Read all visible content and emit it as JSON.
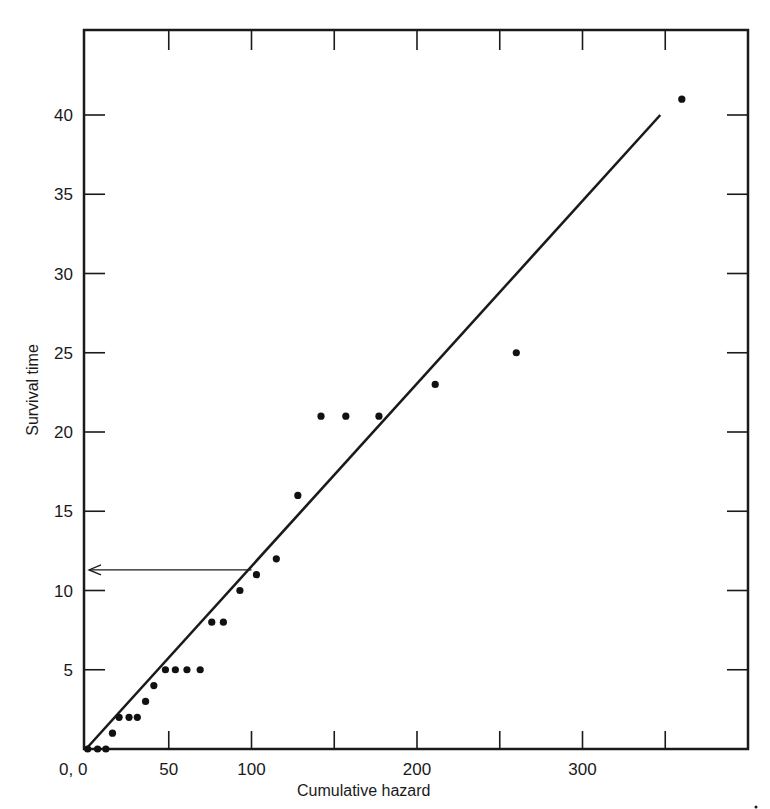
{
  "chart_data": {
    "type": "scatter",
    "title": "",
    "xlabel": "Cumulative hazard",
    "ylabel": "Survival time",
    "xlim": [
      0,
      400
    ],
    "ylim": [
      0,
      43
    ],
    "grid": false,
    "legend": null,
    "x_tick_labels": [
      {
        "value": 0,
        "label": "0, 0"
      },
      {
        "value": 50,
        "label": "50"
      },
      {
        "value": 100,
        "label": "100"
      },
      {
        "value": 200,
        "label": "200"
      },
      {
        "value": 300,
        "label": "300"
      }
    ],
    "x_ticks": [
      50,
      100,
      150,
      200,
      250,
      300,
      350
    ],
    "y_tick_labels": [
      {
        "value": 5,
        "label": "5"
      },
      {
        "value": 10,
        "label": "10"
      },
      {
        "value": 15,
        "label": "15"
      },
      {
        "value": 20,
        "label": "20"
      },
      {
        "value": 25,
        "label": "25"
      },
      {
        "value": 30,
        "label": "30"
      },
      {
        "value": 35,
        "label": "35"
      },
      {
        "value": 40,
        "label": "40"
      }
    ],
    "series": [
      {
        "name": "observations",
        "points": [
          {
            "x": 1,
            "y": 0
          },
          {
            "x": 7,
            "y": 0
          },
          {
            "x": 12,
            "y": 0
          },
          {
            "x": 16,
            "y": 1
          },
          {
            "x": 20,
            "y": 2
          },
          {
            "x": 26,
            "y": 2
          },
          {
            "x": 31,
            "y": 2
          },
          {
            "x": 36,
            "y": 3
          },
          {
            "x": 41,
            "y": 4
          },
          {
            "x": 48,
            "y": 5
          },
          {
            "x": 54,
            "y": 5
          },
          {
            "x": 61,
            "y": 5
          },
          {
            "x": 69,
            "y": 5
          },
          {
            "x": 76,
            "y": 8
          },
          {
            "x": 83,
            "y": 8
          },
          {
            "x": 93,
            "y": 10
          },
          {
            "x": 103,
            "y": 11
          },
          {
            "x": 115,
            "y": 12
          },
          {
            "x": 128,
            "y": 16
          },
          {
            "x": 142,
            "y": 21
          },
          {
            "x": 157,
            "y": 21
          },
          {
            "x": 177,
            "y": 21
          },
          {
            "x": 211,
            "y": 23
          },
          {
            "x": 260,
            "y": 25
          },
          {
            "x": 360,
            "y": 41
          }
        ]
      }
    ],
    "fit_line": {
      "x1": 0,
      "y1": 0,
      "x2": 347,
      "y2": 40
    },
    "annotation_arrow": {
      "from_x": 100,
      "y": 11.3,
      "to_x": 0,
      "note": "reading survival time at cumulative hazard 100"
    }
  }
}
